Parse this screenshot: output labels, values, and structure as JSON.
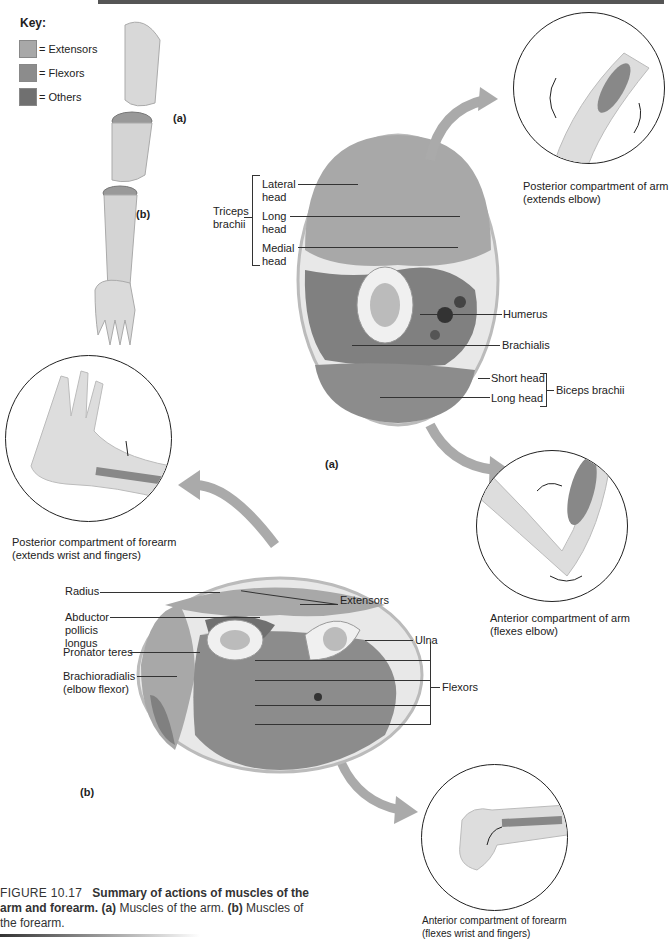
{
  "key": {
    "title": "Key:",
    "items": [
      {
        "label": "= Extensors",
        "color": "#a8a8a8"
      },
      {
        "label": "= Flexors",
        "color": "#8c8c8c"
      },
      {
        "label": "= Others",
        "color": "#707070"
      }
    ]
  },
  "arm_figure": {
    "label_a": "(a)",
    "label_b": "(b)"
  },
  "section_a": {
    "label": "(a)",
    "triceps": {
      "group_label_line1": "Triceps",
      "group_label_line2": "brachii",
      "lateral_line1": "Lateral",
      "lateral_line2": "head",
      "long_line1": "Long",
      "long_line2": "head",
      "medial_line1": "Medial",
      "medial_line2": "head"
    },
    "humerus": "Humerus",
    "brachialis": "Brachialis",
    "biceps": {
      "short_head": "Short head",
      "long_head": "Long head",
      "group_label": "Biceps brachii"
    }
  },
  "section_b": {
    "label": "(b)",
    "extensors": "Extensors",
    "radius": "Radius",
    "abductor_line1": "Abductor",
    "abductor_line2": "pollicis",
    "abductor_line3": "longus",
    "ulna": "Ulna",
    "pronator": "Pronator teres",
    "brachioradialis_line1": "Brachioradialis",
    "brachioradialis_line2": "(elbow flexor)",
    "flexors": "Flexors"
  },
  "insets": {
    "posterior_arm_line1": "Posterior compartment of arm",
    "posterior_arm_line2": "(extends elbow)",
    "anterior_arm_line1": "Anterior compartment of arm",
    "anterior_arm_line2": "(flexes elbow)",
    "posterior_forearm_line1": "Posterior compartment of forearm",
    "posterior_forearm_line2": "(extends wrist and fingers)",
    "anterior_forearm_line1": "Anterior compartment of forearm",
    "anterior_forearm_line2": "(flexes wrist and fingers)"
  },
  "caption": {
    "figure_number": "FIGURE 10.17",
    "title_part1": "Summary of actions of muscles of the",
    "title_part2": "arm and forearm.",
    "a_label": "(a)",
    "a_text": " Muscles of the arm. ",
    "b_label": "(b)",
    "b_text": " Muscles of",
    "tail": "the forearm."
  }
}
